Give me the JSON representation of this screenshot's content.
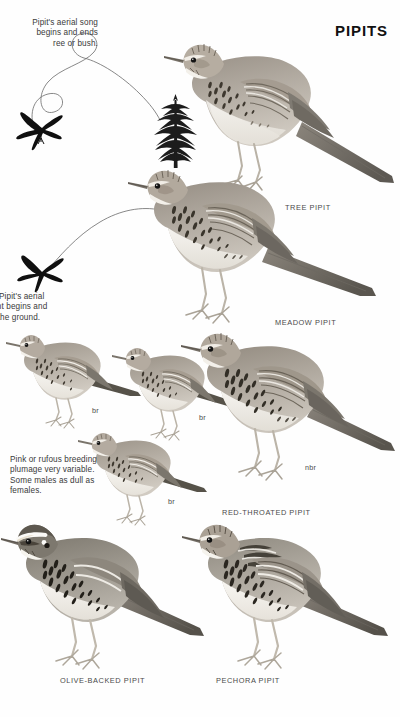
{
  "page": {
    "title": "PIPITS",
    "background_color": "#ffffff",
    "ink_color": "#1a1a1a"
  },
  "notes": [
    {
      "id": "tree-pipit-song",
      "text": "Pipit's aerial song\nbegins and ends\nree or bush.",
      "full_text_clipped_left": true
    },
    {
      "id": "meadow-pipit-song",
      "text": "ow Pipit's aerial\nflight begins and\non the ground.",
      "full_text_clipped_left": true
    },
    {
      "id": "breeding-plumage",
      "text": "Pink or rufous breeding\nplumage very variable.\nSome males as dull as\nfemales.",
      "full_text_clipped_left": false
    }
  ],
  "species_labels": [
    {
      "id": "tree-pipit",
      "text": "TREE PIPIT"
    },
    {
      "id": "meadow-pipit",
      "text": "MEADOW PIPIT"
    },
    {
      "id": "red-throated-pipit",
      "text": "RED-THROATED PIPIT"
    },
    {
      "id": "olive-backed-pipit",
      "text": "OLIVE-BACKED PIPIT"
    },
    {
      "id": "pechora-pipit",
      "text": "PECHORA PIPIT"
    }
  ],
  "age_labels": [
    {
      "id": "br-1",
      "text": "br"
    },
    {
      "id": "br-2",
      "text": "br"
    },
    {
      "id": "br-3",
      "text": "br"
    },
    {
      "id": "nbr-1",
      "text": "nbr"
    }
  ],
  "figures": [
    {
      "id": "tree-pipit-perched",
      "caption": "TREE PIPIT"
    },
    {
      "id": "meadow-pipit-perched",
      "caption": "MEADOW PIPIT"
    },
    {
      "id": "red-throated-pipit-br-left",
      "caption": "br"
    },
    {
      "id": "red-throated-pipit-br-mid",
      "caption": "br"
    },
    {
      "id": "red-throated-pipit-br-low",
      "caption": "br"
    },
    {
      "id": "red-throated-pipit-nbr",
      "caption": "nbr"
    },
    {
      "id": "olive-backed-pipit",
      "caption": "OLIVE-BACKED PIPIT"
    },
    {
      "id": "pechora-pipit",
      "caption": "PECHORA PIPIT"
    },
    {
      "id": "song-flight-silhouette-tree",
      "caption": ""
    },
    {
      "id": "song-flight-silhouette-meadow",
      "caption": ""
    },
    {
      "id": "conifer-tree",
      "caption": ""
    },
    {
      "id": "song-flight-path-tree",
      "caption": ""
    },
    {
      "id": "song-flight-path-meadow",
      "caption": ""
    }
  ]
}
